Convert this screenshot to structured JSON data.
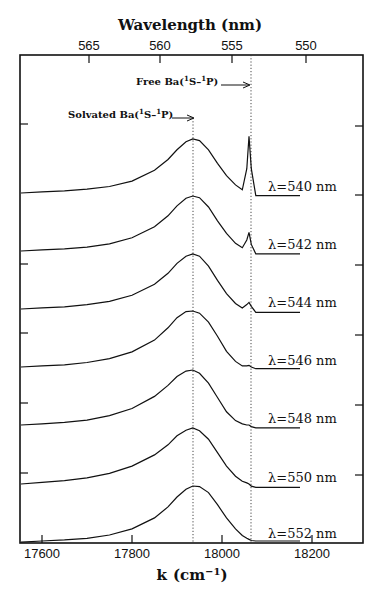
{
  "chart_data": {
    "type": "line",
    "title": "",
    "xlabel": "k (cm⁻¹)",
    "x2label": "Wavelength (nm)",
    "ylabel": "",
    "xlim": [
      17550,
      18310
    ],
    "x_ticks": [
      17600,
      17800,
      18000,
      18200
    ],
    "x_tick_labels": [
      "17600",
      "17800",
      "18000",
      "18200"
    ],
    "x2_ticks_nm": [
      565,
      560,
      555,
      550
    ],
    "x2_tick_labels": [
      "565",
      "560",
      "555",
      "550"
    ],
    "grid": false,
    "legend": "inline labels at right of each trace",
    "stacked_offset": true,
    "reference_lines": [
      {
        "name": "Solvated Ba(¹S–¹P)",
        "k": 17935,
        "style": "dotted"
      },
      {
        "name": "Free Ba(¹S–¹P)",
        "k": 18060,
        "style": "dotted"
      }
    ],
    "annotations": [
      {
        "text": "Free Ba(¹S–¹P)",
        "arrow_to_k": 18060
      },
      {
        "text": "Solvated Ba(¹S–¹P)",
        "arrow_to_k": 17935
      }
    ],
    "x": [
      17550,
      17600,
      17650,
      17700,
      17750,
      17800,
      17850,
      17880,
      17900,
      17920,
      17935,
      17950,
      17970,
      17990,
      18010,
      18030,
      18045,
      18055,
      18060,
      18065,
      18075,
      18100,
      18150
    ],
    "series": [
      {
        "name": "λ=540 nm",
        "peak_k": 17925,
        "relative_peak": 1.0,
        "free_atom_peak": 1.05,
        "values": [
          0.0,
          0.02,
          0.04,
          0.07,
          0.12,
          0.22,
          0.42,
          0.62,
          0.8,
          0.95,
          1.0,
          0.97,
          0.8,
          0.55,
          0.32,
          0.15,
          0.06,
          0.45,
          1.05,
          0.45,
          -0.05,
          -0.05,
          -0.05
        ]
      },
      {
        "name": "λ=542 nm",
        "peak_k": 17925,
        "relative_peak": 1.0,
        "free_atom_peak": 0.34,
        "values": [
          0.0,
          0.02,
          0.04,
          0.07,
          0.13,
          0.24,
          0.44,
          0.64,
          0.82,
          0.96,
          1.0,
          0.97,
          0.8,
          0.55,
          0.32,
          0.14,
          0.06,
          0.2,
          0.34,
          0.12,
          -0.05,
          -0.05,
          -0.05
        ]
      },
      {
        "name": "λ=544 nm",
        "peak_k": 17930,
        "relative_peak": 1.0,
        "free_atom_peak": 0.12,
        "values": [
          0.0,
          0.02,
          0.04,
          0.08,
          0.14,
          0.25,
          0.45,
          0.65,
          0.83,
          0.96,
          1.0,
          0.96,
          0.78,
          0.52,
          0.28,
          0.1,
          0.02,
          0.08,
          0.12,
          0.05,
          -0.06,
          -0.06,
          -0.06
        ]
      },
      {
        "name": "λ=546 nm",
        "peak_k": 17930,
        "relative_peak": 1.0,
        "free_atom_peak": 0.03,
        "values": [
          0.0,
          0.02,
          0.04,
          0.08,
          0.15,
          0.27,
          0.48,
          0.7,
          0.88,
          0.99,
          1.0,
          0.96,
          0.8,
          0.55,
          0.28,
          0.1,
          0.02,
          0.02,
          0.03,
          0.0,
          -0.03,
          -0.03,
          -0.03
        ]
      },
      {
        "name": "λ=548 nm",
        "peak_k": 17935,
        "relative_peak": 1.0,
        "free_atom_peak": 0.0,
        "values": [
          0.0,
          0.02,
          0.05,
          0.09,
          0.17,
          0.3,
          0.52,
          0.72,
          0.88,
          0.98,
          1.0,
          0.94,
          0.76,
          0.5,
          0.24,
          0.08,
          0.02,
          0.0,
          0.0,
          -0.03,
          -0.05,
          -0.05,
          -0.05
        ]
      },
      {
        "name": "λ=550 nm",
        "peak_k": 17935,
        "relative_peak": 1.0,
        "free_atom_peak": 0.0,
        "values": [
          0.0,
          0.03,
          0.06,
          0.11,
          0.19,
          0.32,
          0.52,
          0.7,
          0.86,
          0.96,
          1.0,
          0.95,
          0.8,
          0.56,
          0.32,
          0.14,
          0.05,
          0.02,
          0.0,
          -0.04,
          -0.06,
          -0.06,
          -0.06
        ]
      },
      {
        "name": "λ=552 nm",
        "peak_k": 17940,
        "relative_peak": 1.0,
        "free_atom_peak": 0.0,
        "values": [
          -0.02,
          0.0,
          0.02,
          0.05,
          0.11,
          0.22,
          0.42,
          0.62,
          0.8,
          0.94,
          1.0,
          0.99,
          0.88,
          0.66,
          0.42,
          0.22,
          0.1,
          0.05,
          0.03,
          0.01,
          0.0,
          0.0,
          0.0
        ]
      }
    ]
  },
  "axes": {
    "top_title": "Wavelength (nm)",
    "bottom_title_main": "k",
    "bottom_title_unit": "(cm",
    "bottom_title_sup": "−1",
    "bottom_title_close": ")"
  },
  "annotations": {
    "free_label": "Free Ba(",
    "free_sup1": "1",
    "free_mid": "S–",
    "free_sup2": "1",
    "free_end": "P)",
    "solv_label": "Solvated Ba(",
    "solv_sup1": "1",
    "solv_mid": "S–",
    "solv_sup2": "1",
    "solv_end": "P)"
  },
  "series_labels": [
    "λ=540  nm",
    "λ=542  nm",
    "λ=544  nm",
    "λ=546  nm",
    "λ=548  nm",
    "λ=550  nm",
    "λ=552  nm"
  ],
  "colors": {
    "line": "#111111",
    "frame": "#111111",
    "background": "#ffffff"
  }
}
